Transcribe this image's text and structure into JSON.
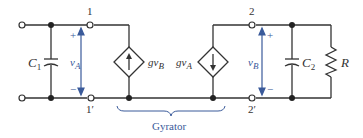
{
  "diagram": {
    "colors": {
      "wire": "#333333",
      "accent_blue": "#3a5a9a",
      "background": "#ffffff"
    },
    "terminals": {
      "t1": "1",
      "t1p": "1′",
      "t2": "2",
      "t2p": "2′"
    },
    "components": {
      "c1": {
        "symbol": "C",
        "sub": "1"
      },
      "c2": {
        "symbol": "C",
        "sub": "2"
      },
      "r": {
        "symbol": "R"
      },
      "src_left": {
        "prefix": "gv",
        "sub": "B"
      },
      "src_right": {
        "prefix": "gv",
        "sub": "A"
      }
    },
    "voltages": {
      "va": {
        "symbol": "v",
        "sub": "A",
        "plus": "+",
        "minus": "−"
      },
      "vb": {
        "symbol": "v",
        "sub": "B",
        "plus": "+",
        "minus": "−"
      }
    },
    "brace_label": "Gyrator"
  }
}
